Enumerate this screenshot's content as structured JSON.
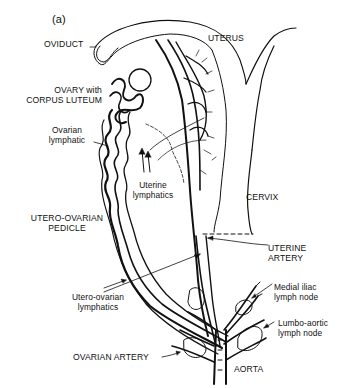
{
  "figure": {
    "panel_label": "(a)",
    "colors": {
      "ink": "#111111",
      "background": "#ffffff"
    },
    "labels": {
      "oviduct": "OVIDUCT",
      "uterus": "UTERUS",
      "ovary_line1": "OVARY with",
      "ovary_line2": "CORPUS LUTEUM",
      "ovarian_lymphatic_line1": "Ovarian",
      "ovarian_lymphatic_line2": "lymphatic",
      "uterine_lymphatics_line1": "Uterine",
      "uterine_lymphatics_line2": "lymphatics",
      "cervix": "CERVIX",
      "pedicle_line1": "UTERO-OVARIAN",
      "pedicle_line2": "PEDICLE",
      "uterine_artery_line1": "UTERINE",
      "uterine_artery_line2": "ARTERY",
      "utero_ovarian_lymphatics_line1": "Utero-ovarian",
      "utero_ovarian_lymphatics_line2": "lymphatics",
      "medial_iliac_line1": "Medial iliac",
      "medial_iliac_line2": "lymph node",
      "lumbo_aortic_line1": "Lumbo-aortic",
      "lumbo_aortic_line2": "lymph node",
      "ovarian_artery": "OVARIAN ARTERY",
      "aorta": "AORTA"
    }
  }
}
